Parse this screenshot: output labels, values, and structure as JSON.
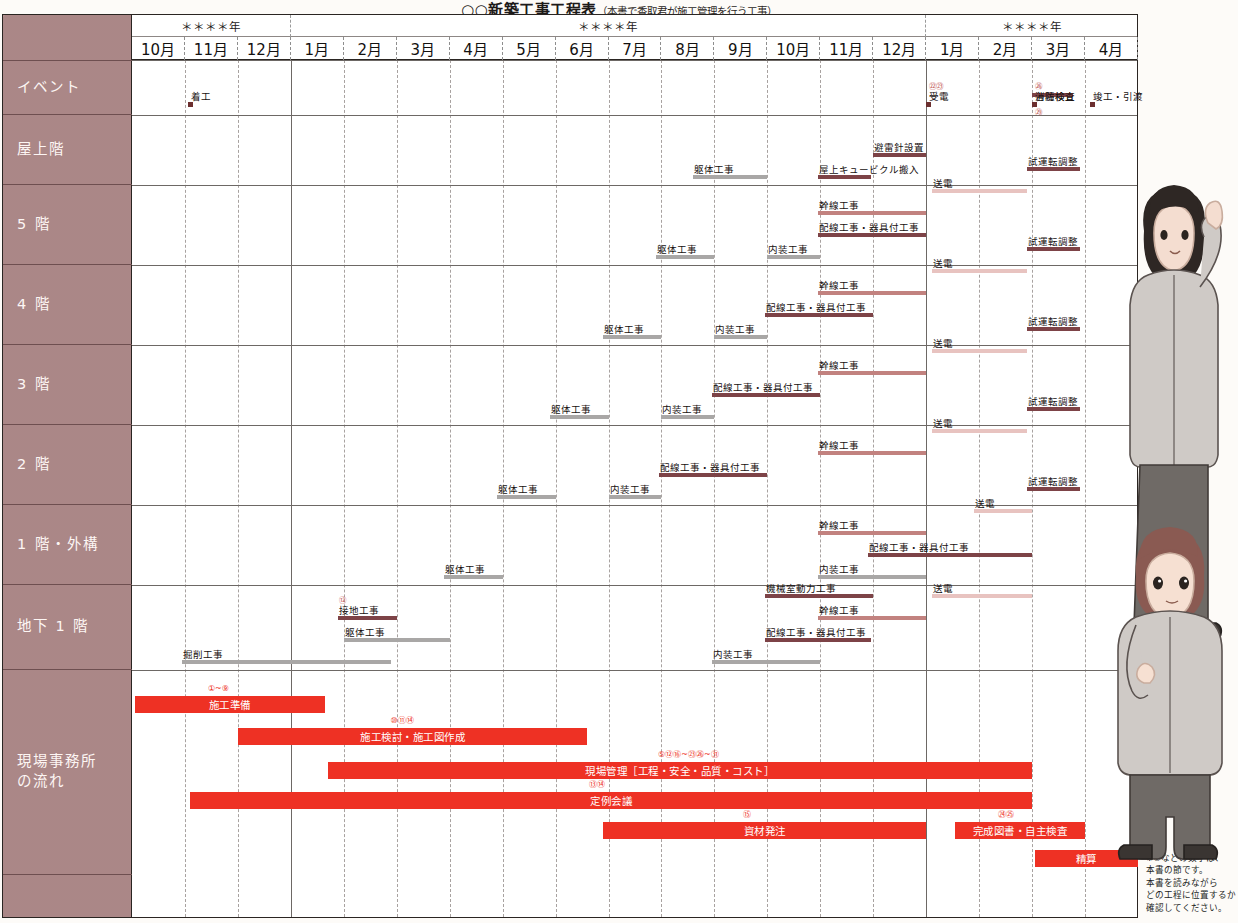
{
  "title": {
    "main": "○○新築工事工程表",
    "sub": "（本書で香取君が施工管理を行う工事）"
  },
  "header": {
    "years": [
      "＊＊＊＊年",
      "＊＊＊＊年",
      "＊＊＊＊年"
    ],
    "months": [
      "10月",
      "11月",
      "12月",
      "1月",
      "2月",
      "3月",
      "4月",
      "5月",
      "6月",
      "7月",
      "8月",
      "9月",
      "10月",
      "11月",
      "12月",
      "1月",
      "2月",
      "3月",
      "4月"
    ]
  },
  "rows": [
    {
      "label": "イベント"
    },
    {
      "label": "屋上階"
    },
    {
      "label": "5 階"
    },
    {
      "label": "4 階"
    },
    {
      "label": "3 階"
    },
    {
      "label": "2 階"
    },
    {
      "label": "1 階・外構"
    },
    {
      "label": "地下 1 階"
    },
    {
      "label": "現場事務所\nの流れ"
    }
  ],
  "footnote": "※①などの数字は、\n 本書の節です。\n 本書を読みながら\n どの工程に位置するか\n 確認してください。",
  "colors": {
    "label_bg": "#b08b8b",
    "gray": "#a9a7a6",
    "dark_red": "#7d4347",
    "mid_red": "#c2827f",
    "light_red": "#e8c3c0",
    "red": "#ee3124",
    "milestone": "#6c2f2f"
  },
  "chart_data": {
    "type": "gantt",
    "title": "○○新築工事工程表",
    "x_unit": "month",
    "x_columns": 19,
    "categories": [
      "10月",
      "11月",
      "12月",
      "1月",
      "2月",
      "3月",
      "4月",
      "5月",
      "6月",
      "7月",
      "8月",
      "9月",
      "10月",
      "11月",
      "12月",
      "1月",
      "2月",
      "3月",
      "4月"
    ],
    "rows": [
      {
        "name": "イベント",
        "milestones": [
          {
            "label": "着工",
            "month": 1.05,
            "number": ""
          },
          {
            "label": "受電",
            "month": 15.0,
            "number": "㉒㉓"
          },
          {
            "label": "各種検査",
            "month": 17.0,
            "number": "㉖",
            "bar": true
          },
          {
            "label": "消防検査",
            "month": 17.0,
            "number": "㉙",
            "number_below": true
          },
          {
            "label": "竣工・引渡",
            "month": 18.1,
            "number": ""
          }
        ],
        "tasks": []
      },
      {
        "name": "屋上階",
        "tasks": [
          {
            "label": "躯体工事",
            "start": 10.6,
            "end": 12.0,
            "color": "gray",
            "lane": 0
          },
          {
            "label": "屋上キュービクル搬入",
            "start": 12.95,
            "end": 13.95,
            "color": "dkred",
            "lane": 0
          },
          {
            "label": "避雷針設置",
            "start": 14.0,
            "end": 15.0,
            "color": "dkred",
            "lane": 1
          }
        ]
      },
      {
        "name": "5 階",
        "tasks": [
          {
            "label": "躯体工事",
            "start": 9.9,
            "end": 11.0,
            "color": "gray",
            "lane": 0
          },
          {
            "label": "内装工事",
            "start": 12.0,
            "end": 13.0,
            "color": "gray",
            "lane": 0
          },
          {
            "label": "配線工事・器具付工事",
            "start": 12.95,
            "end": 15.0,
            "color": "dkred",
            "lane": 1
          },
          {
            "label": "幹線工事",
            "start": 12.95,
            "end": 15.0,
            "color": "midred",
            "lane": 2
          },
          {
            "label": "送電",
            "start": 15.1,
            "end": 16.9,
            "color": "ltred",
            "lane": 3
          },
          {
            "label": "試運転調整",
            "start": 16.9,
            "end": 17.9,
            "color": "dkred",
            "lane": 4
          }
        ]
      },
      {
        "name": "4 階",
        "tasks": [
          {
            "label": "躯体工事",
            "start": 8.9,
            "end": 10.0,
            "color": "gray",
            "lane": 0
          },
          {
            "label": "内装工事",
            "start": 11.0,
            "end": 12.0,
            "color": "gray",
            "lane": 0
          },
          {
            "label": "配線工事・器具付工事",
            "start": 11.95,
            "end": 14.0,
            "color": "dkred",
            "lane": 1
          },
          {
            "label": "幹線工事",
            "start": 12.95,
            "end": 15.0,
            "color": "midred",
            "lane": 2
          },
          {
            "label": "送電",
            "start": 15.1,
            "end": 16.9,
            "color": "ltred",
            "lane": 3
          },
          {
            "label": "試運転調整",
            "start": 16.9,
            "end": 17.9,
            "color": "dkred",
            "lane": 4
          }
        ]
      },
      {
        "name": "3 階",
        "tasks": [
          {
            "label": "躯体工事",
            "start": 7.9,
            "end": 9.0,
            "color": "gray",
            "lane": 0
          },
          {
            "label": "内装工事",
            "start": 10.0,
            "end": 11.0,
            "color": "gray",
            "lane": 0
          },
          {
            "label": "配線工事・器具付工事",
            "start": 10.95,
            "end": 13.0,
            "color": "dkred",
            "lane": 1
          },
          {
            "label": "幹線工事",
            "start": 12.95,
            "end": 15.0,
            "color": "midred",
            "lane": 2
          },
          {
            "label": "送電",
            "start": 15.1,
            "end": 16.9,
            "color": "ltred",
            "lane": 3
          },
          {
            "label": "試運転調整",
            "start": 16.9,
            "end": 17.9,
            "color": "dkred",
            "lane": 4
          }
        ]
      },
      {
        "name": "2 階",
        "tasks": [
          {
            "label": "躯体工事",
            "start": 6.9,
            "end": 8.0,
            "color": "gray",
            "lane": 0
          },
          {
            "label": "内装工事",
            "start": 9.0,
            "end": 10.0,
            "color": "gray",
            "lane": 0
          },
          {
            "label": "配線工事・器具付工事",
            "start": 9.95,
            "end": 12.0,
            "color": "dkred",
            "lane": 1
          },
          {
            "label": "幹線工事",
            "start": 12.95,
            "end": 15.0,
            "color": "midred",
            "lane": 2
          },
          {
            "label": "送電",
            "start": 15.1,
            "end": 16.9,
            "color": "ltred",
            "lane": 3
          },
          {
            "label": "試運転調整",
            "start": 16.9,
            "end": 17.9,
            "color": "dkred",
            "lane": 4
          }
        ]
      },
      {
        "name": "1 階・外構",
        "tasks": [
          {
            "label": "躯体工事",
            "start": 5.9,
            "end": 7.0,
            "color": "gray",
            "lane": 0
          },
          {
            "label": "内装工事",
            "start": 12.95,
            "end": 15.0,
            "color": "gray",
            "lane": 0
          },
          {
            "label": "配線工事・器具付工事",
            "start": 13.9,
            "end": 17.0,
            "color": "dkred",
            "lane": 1
          },
          {
            "label": "幹線工事",
            "start": 12.95,
            "end": 15.0,
            "color": "midred",
            "lane": 2
          },
          {
            "label": "送電",
            "start": 15.9,
            "end": 17.0,
            "color": "ltred",
            "lane": 3
          },
          {
            "label": "試運転調整",
            "start": 16.9,
            "end": 17.9,
            "color": "dkred",
            "lane": 4
          }
        ]
      },
      {
        "name": "地下 1 階",
        "tasks": [
          {
            "label": "掘削工事",
            "start": 0.95,
            "end": 4.9,
            "color": "gray",
            "lane": 0
          },
          {
            "label": "躯体工事",
            "start": 4.0,
            "end": 6.0,
            "color": "gray",
            "lane": 1
          },
          {
            "label": "接地工事",
            "start": 3.9,
            "end": 5.0,
            "color": "dkred",
            "lane": 2,
            "number": "⑫"
          },
          {
            "label": "内装工事",
            "start": 10.95,
            "end": 13.0,
            "color": "gray",
            "lane": 0
          },
          {
            "label": "配線工事・器具付工事",
            "start": 11.95,
            "end": 13.95,
            "color": "dkred",
            "lane": 1
          },
          {
            "label": "機械室動力工事",
            "start": 11.95,
            "end": 14.0,
            "color": "dkred",
            "lane": 3
          },
          {
            "label": "幹線工事",
            "start": 12.95,
            "end": 15.0,
            "color": "midred",
            "lane": 2
          },
          {
            "label": "送電",
            "start": 15.1,
            "end": 17.0,
            "color": "ltred",
            "lane": 3
          }
        ]
      }
    ],
    "site_office_tasks": [
      {
        "label": "施工準備",
        "start": 0.05,
        "end": 3.65,
        "number": "①~⑨",
        "lane": 0
      },
      {
        "label": "施工検討・施工図作成",
        "start": 2.0,
        "end": 8.6,
        "number": "⑩⑪⑭",
        "lane": 1
      },
      {
        "label": "現場管理［工程・安全・品質・コスト］",
        "start": 3.7,
        "end": 17.0,
        "number": "⑤⑫⑯~㉓㉖~㉛",
        "lane": 2
      },
      {
        "label": "定例会議",
        "start": 1.1,
        "end": 17.0,
        "number": "⑬⑭",
        "lane": 3
      },
      {
        "label": "資材発注",
        "start": 8.9,
        "end": 15.0,
        "number": "⑮",
        "lane": 4
      },
      {
        "label": "完成図書・自主検査",
        "start": 15.55,
        "end": 18.0,
        "number": "㉔㉕",
        "lane": 4
      },
      {
        "label": "精算",
        "start": 17.05,
        "end": 19.0,
        "number": "",
        "lane": 5
      }
    ]
  }
}
